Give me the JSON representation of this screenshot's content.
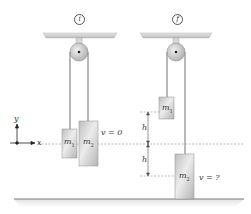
{
  "diagram": {
    "panels": [
      {
        "id": "initial",
        "state_label": "i",
        "masses": [
          {
            "name": "m",
            "sub": "1"
          },
          {
            "name": "m",
            "sub": "2"
          }
        ],
        "velocity_label": "v = 0"
      },
      {
        "id": "final",
        "state_label": "f",
        "masses": [
          {
            "name": "m",
            "sub": "1"
          },
          {
            "name": "m",
            "sub": "2"
          }
        ],
        "velocity_label": "v = ?",
        "height_labels": [
          "h",
          "h"
        ]
      }
    ],
    "axes": {
      "x_label": "x",
      "y_label": "y"
    },
    "colors": {
      "ceiling": "#d4d4d4",
      "pulley": "#c8c8c8",
      "rope": "#9a9a9a",
      "block": "#cfcfcf",
      "block_border": "#8f8f8f",
      "dashed": "#8a8a8a",
      "floor": "#7a7a7a"
    }
  }
}
